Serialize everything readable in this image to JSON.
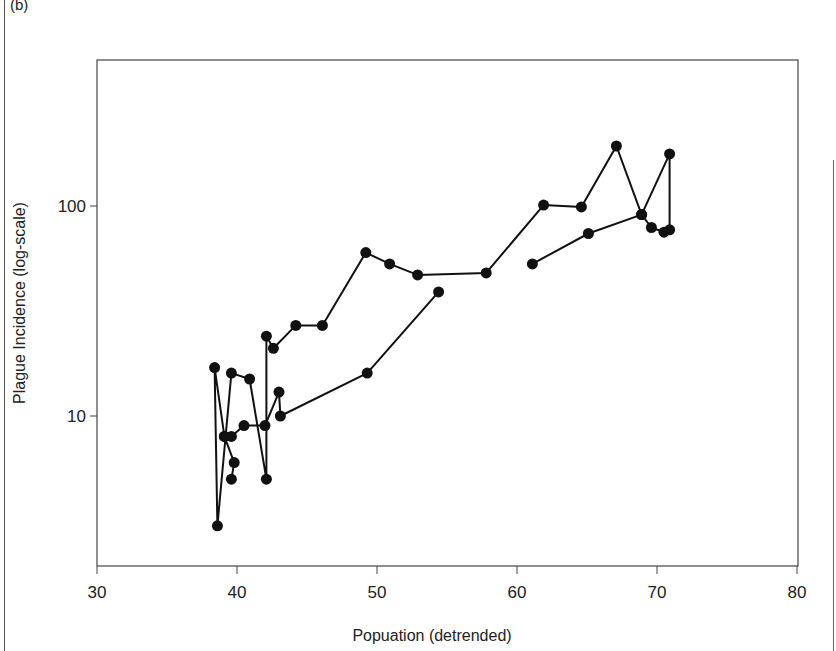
{
  "figure": {
    "panel_label": "(b)"
  },
  "chart_data": {
    "type": "line",
    "title": "",
    "xlabel": "Popuation (detrended)",
    "ylabel": "Plague Incidence (log-scale)",
    "xlim": [
      30,
      80
    ],
    "ylim_log": [
      2,
      500
    ],
    "yscale": "log",
    "x_ticks": [
      30,
      40,
      50,
      60,
      70,
      80
    ],
    "y_ticks": [
      10,
      100
    ],
    "grid": false,
    "legend": null,
    "marker": "filled-circle",
    "color": "#111111",
    "series": [
      {
        "name": "trajectory-main",
        "points": [
          [
            61.1,
            53
          ],
          [
            65.1,
            74
          ],
          [
            68.9,
            91
          ],
          [
            69.6,
            79
          ],
          [
            70.5,
            75
          ],
          [
            70.9,
            77
          ],
          [
            70.9,
            177
          ],
          [
            68.9,
            91
          ],
          [
            67.1,
            193
          ],
          [
            64.6,
            99
          ],
          [
            61.9,
            101
          ],
          [
            57.8,
            48
          ],
          [
            52.9,
            47
          ],
          [
            50.9,
            53
          ],
          [
            49.2,
            60
          ],
          [
            46.1,
            27
          ],
          [
            44.2,
            27
          ],
          [
            42.6,
            21
          ],
          [
            42.1,
            24
          ],
          [
            42.1,
            5
          ],
          [
            40.9,
            15
          ],
          [
            39.6,
            16
          ],
          [
            38.6,
            3
          ],
          [
            38.4,
            17
          ],
          [
            39.1,
            8
          ],
          [
            39.8,
            6
          ],
          [
            39.6,
            5
          ]
        ]
      },
      {
        "name": "trajectory-branch",
        "points": [
          [
            39.1,
            8
          ],
          [
            39.6,
            8
          ],
          [
            40.5,
            9
          ],
          [
            42.0,
            9
          ],
          [
            43.0,
            13
          ],
          [
            43.1,
            10
          ],
          [
            49.3,
            16
          ],
          [
            54.4,
            39
          ]
        ]
      }
    ]
  },
  "axes": {
    "x_tick_labels": [
      "30",
      "40",
      "50",
      "60",
      "70",
      "80"
    ],
    "y_tick_labels": [
      "100",
      "10"
    ]
  }
}
